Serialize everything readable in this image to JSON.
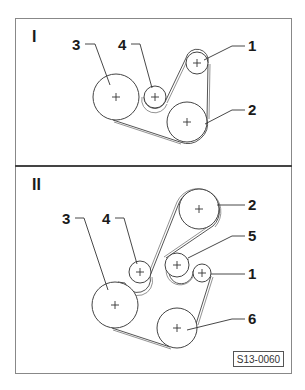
{
  "figure_id": "S13-0060",
  "sections": [
    {
      "label": "I",
      "pulleys": [
        {
          "id": "1",
          "cx": 197,
          "cy": 63,
          "r": 11
        },
        {
          "id": "2",
          "cx": 187,
          "cy": 122,
          "r": 20
        },
        {
          "id": "3",
          "cx": 116,
          "cy": 97,
          "r": 23
        },
        {
          "id": "4",
          "cx": 155,
          "cy": 97,
          "r": 11
        }
      ]
    },
    {
      "label": "II",
      "pulleys": [
        {
          "id": "1",
          "cx": 202,
          "cy": 273,
          "r": 9
        },
        {
          "id": "2",
          "cx": 199,
          "cy": 209,
          "r": 20
        },
        {
          "id": "3",
          "cx": 115,
          "cy": 305,
          "r": 23
        },
        {
          "id": "4",
          "cx": 140,
          "cy": 272,
          "r": 11
        },
        {
          "id": "5",
          "cx": 177,
          "cy": 265,
          "r": 12
        },
        {
          "id": "6",
          "cx": 177,
          "cy": 328,
          "r": 20
        }
      ]
    }
  ],
  "labels": {
    "s1": {
      "roman": "I",
      "n1": "1",
      "n2": "2",
      "n3": "3",
      "n4": "4"
    },
    "s2": {
      "roman": "II",
      "n1": "1",
      "n2": "2",
      "n3": "3",
      "n4": "4",
      "n5": "5",
      "n6": "6"
    }
  },
  "colors": {
    "line": "#444444",
    "background": "#ffffff",
    "frame": "#888888"
  }
}
